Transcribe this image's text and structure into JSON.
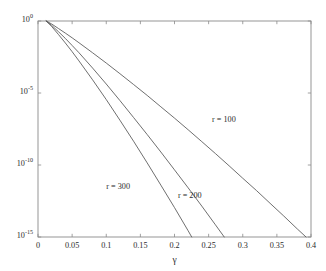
{
  "figure": {
    "background_color": "#ffffff",
    "axis_color": "#8a8a8a",
    "curve_color": "#555555",
    "text_color": "#2b2b2b"
  },
  "chart_data": {
    "type": "line",
    "title": "",
    "xlabel": "γ",
    "ylabel": "",
    "xlim": [
      0,
      0.4
    ],
    "ylim": [
      1e-15,
      1
    ],
    "yscale": "log",
    "xscale": "linear",
    "grid": false,
    "legend": "inline-annotations",
    "xticks": [
      0,
      0.05,
      0.1,
      0.15,
      0.2,
      0.25,
      0.3,
      0.35,
      0.4
    ],
    "xtick_labels": [
      "0",
      "0.05",
      "0.1",
      "0.15",
      "0.2",
      "0.25",
      "0.3",
      "0.35",
      "0.4"
    ],
    "yticks": [
      1,
      1e-05,
      1e-10,
      1e-15
    ],
    "ytick_labels": [
      "10^0",
      "10^-5",
      "10^-10",
      "10^-15"
    ],
    "ytick_mantissas": [
      "10",
      "10",
      "10",
      "10"
    ],
    "ytick_exponents": [
      "0",
      "-5",
      "-10",
      "-15"
    ],
    "annotations": [
      {
        "text": "r = 100",
        "x": 0.255,
        "y": 1.2e-07
      },
      {
        "text": "r = 200",
        "x": 0.205,
        "y": 6e-13
      },
      {
        "text": "r = 300",
        "x": 0.1,
        "y": 2.5e-12
      }
    ],
    "series": [
      {
        "name": "r = 100",
        "label": "r = 100",
        "x": [
          0.012,
          0.02,
          0.03,
          0.04,
          0.05,
          0.06,
          0.08,
          0.1,
          0.12,
          0.14,
          0.16,
          0.18,
          0.2,
          0.22,
          0.24,
          0.26,
          0.28,
          0.3,
          0.32,
          0.34,
          0.36,
          0.38,
          0.4
        ],
        "y": [
          1.0,
          0.62,
          0.3,
          0.145,
          0.068,
          0.031,
          0.0062,
          0.0012,
          0.00022,
          3.9e-05,
          6.8e-06,
          1.1e-06,
          1.8e-07,
          2.8e-08,
          4.2e-09,
          6.2e-10,
          8.8e-11,
          1.2e-11,
          1.7e-12,
          2.2e-13,
          2.9e-14,
          3.6e-15,
          4.8e-16
        ]
      },
      {
        "name": "r = 200",
        "label": "r = 200",
        "x": [
          0.012,
          0.02,
          0.03,
          0.04,
          0.05,
          0.06,
          0.08,
          0.1,
          0.12,
          0.14,
          0.16,
          0.18,
          0.2,
          0.22,
          0.24,
          0.26,
          0.28,
          0.3,
          0.303
        ],
        "y": [
          1.0,
          0.5,
          0.18,
          0.062,
          0.02,
          0.0063,
          0.00054,
          4.2e-05,
          3e-06,
          2e-07,
          1.3e-08,
          8e-10,
          4.6e-11,
          2.6e-12,
          1.4e-13,
          7e-15,
          3.4e-16,
          1.5e-17,
          1e-15
        ]
      },
      {
        "name": "r = 300",
        "label": "r = 300",
        "x": [
          0.012,
          0.02,
          0.03,
          0.04,
          0.05,
          0.06,
          0.08,
          0.1,
          0.12,
          0.14,
          0.16,
          0.18,
          0.2,
          0.22,
          0.24,
          0.248
        ],
        "y": [
          1.0,
          0.42,
          0.115,
          0.03,
          0.0074,
          0.0017,
          8.2e-05,
          3.5e-06,
          1.3e-07,
          4.5e-09,
          1.4e-10,
          4e-12,
          1.1e-13,
          2.7e-15,
          6e-17,
          1e-15
        ]
      }
    ]
  }
}
